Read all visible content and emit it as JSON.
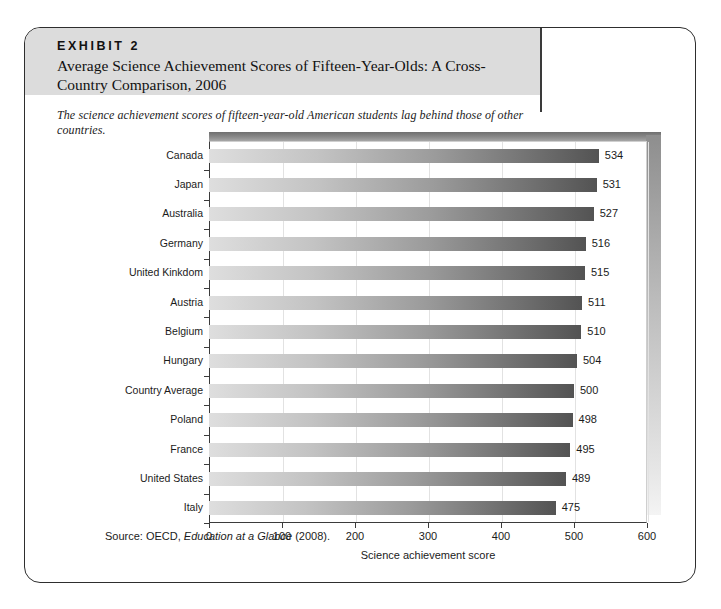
{
  "exhibit": {
    "kicker": "EXHIBIT 2",
    "title": "Average Science Achievement Scores of Fifteen-Year-Olds: A Cross-Country Comparison, 2006",
    "subtitle": "The science achievement scores of fifteen-year-old American students lag behind those of other countries.",
    "source_prefix": "Source: OECD, ",
    "source_italic": "Education at a Glance",
    "source_suffix": " (2008)."
  },
  "chart_data": {
    "type": "bar",
    "orientation": "horizontal",
    "title": "Average Science Achievement Scores of Fifteen-Year-Olds: A Cross-Country Comparison, 2006",
    "xlabel": "Science achievement score",
    "ylabel": "",
    "xlim": [
      0,
      600
    ],
    "xticks": [
      0,
      100,
      200,
      300,
      400,
      500,
      600
    ],
    "grid": true,
    "legend": false,
    "categories": [
      "Canada",
      "Japan",
      "Australia",
      "Germany",
      "United Kinkdom",
      "Austria",
      "Belgium",
      "Hungary",
      "Country Average",
      "Poland",
      "France",
      "United States",
      "Italy"
    ],
    "values": [
      534,
      531,
      527,
      516,
      515,
      511,
      510,
      504,
      500,
      498,
      495,
      489,
      475
    ],
    "bar_gradient_start": "#dedede",
    "bar_gradient_end": "#535353"
  }
}
